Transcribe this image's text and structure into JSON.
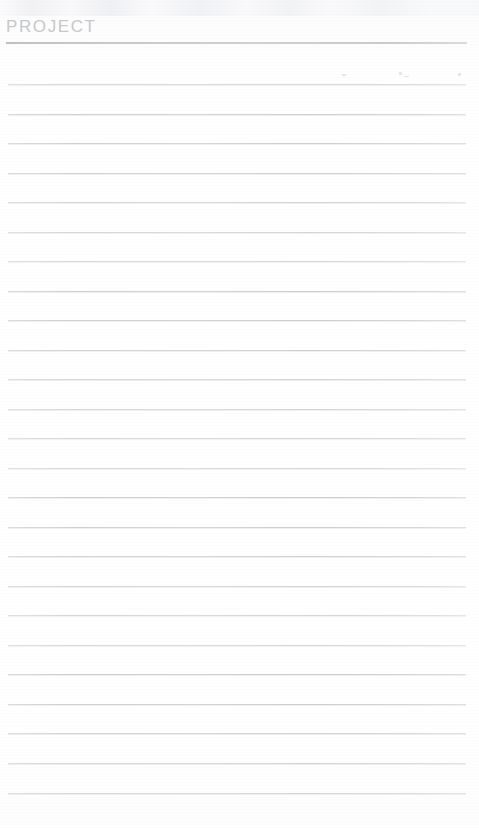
{
  "page": {
    "width": 479,
    "height": 828,
    "background_color": "#ffffff",
    "document_type": "ruled notepad page"
  },
  "header": {
    "title": "PROJECT",
    "title_color": "#c6c8cb",
    "rule_color": "#c2c4c8",
    "rule_y": 42,
    "rule_left": 6,
    "rule_width": 461
  },
  "ruled_lines": {
    "color": "#cdcfd2",
    "left": 8,
    "width": 458,
    "spacing": 29.55,
    "count": 25,
    "first_y": 84,
    "last_y": 793,
    "positions": [
      84,
      113.5,
      143,
      172.5,
      202,
      231.5,
      261,
      290.5,
      320,
      349.5,
      379,
      408.5,
      438,
      467.5,
      497,
      526.5,
      556,
      585.5,
      615,
      644.5,
      674,
      703.5,
      733,
      763,
      793
    ]
  },
  "scan_artifacts": {
    "description": "faint scanner tick marks above the second ruled line on the right side",
    "color": "#e6e7ea",
    "ticks": [
      {
        "x": 342,
        "y": 74,
        "width": 4,
        "height": 2
      },
      {
        "x": 399,
        "y": 72,
        "width": 3,
        "height": 3
      },
      {
        "x": 404,
        "y": 76,
        "width": 5,
        "height": 1
      },
      {
        "x": 458,
        "y": 73,
        "width": 3,
        "height": 3
      }
    ]
  }
}
